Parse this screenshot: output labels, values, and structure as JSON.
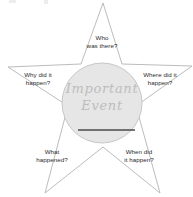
{
  "worksheet": {
    "type": "story-star-graphic-organizer",
    "background_color": "#ffffff"
  },
  "star": {
    "outline_color": "#b4b4b4",
    "fill_color": "#ffffff",
    "points": [
      {
        "id": "who",
        "position": "top",
        "label": "Who\nwas there?"
      },
      {
        "id": "where",
        "position": "right",
        "label": "Where did it\nhappen?"
      },
      {
        "id": "when",
        "position": "bottom-right",
        "label": "When did\nit happen?"
      },
      {
        "id": "what",
        "position": "bottom-left",
        "label": "What\nhappened?"
      },
      {
        "id": "why",
        "position": "left",
        "label": "Why did it\nhappen?"
      }
    ]
  },
  "center": {
    "title": "Important\nEvent",
    "text_color": "#bdbdbd",
    "fill_color": "#e6e6e6",
    "stroke_color": "#c2c2c2",
    "has_write_line": true,
    "write_line_color": "#4a4a4a"
  }
}
